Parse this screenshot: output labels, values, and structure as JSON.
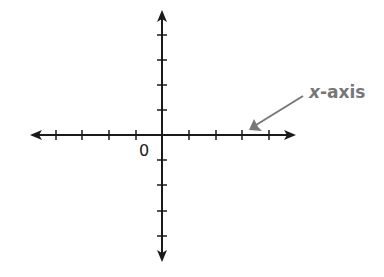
{
  "diagram": {
    "type": "coordinate-axes",
    "origin_label": "0",
    "annotation": {
      "variable": "x",
      "suffix": "-axis"
    },
    "x_ticks_negative": 4,
    "x_ticks_positive": 4,
    "y_ticks_positive": 4,
    "y_ticks_negative": 4,
    "colors": {
      "axes": "#1a1a1a",
      "annotation": "#777777",
      "background": "#ffffff"
    }
  }
}
